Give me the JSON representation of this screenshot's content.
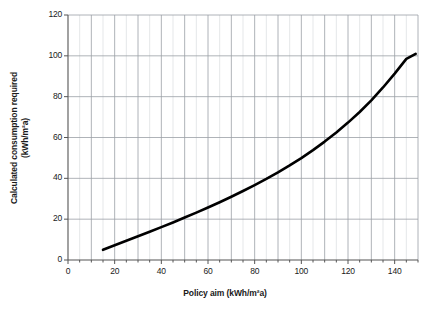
{
  "chart_data": {
    "type": "line",
    "title": "",
    "xlabel": "Policy aim (kWh/m²a)",
    "ylabel_line1": "Calculated consumption required",
    "ylabel_line2": "(kWh/m²a)",
    "xlim": [
      0,
      150
    ],
    "ylim": [
      0,
      120
    ],
    "xticks": [
      0,
      20,
      40,
      60,
      80,
      100,
      120,
      140
    ],
    "yticks": [
      0,
      20,
      40,
      60,
      80,
      100,
      120
    ],
    "xtick_labels": [
      "0",
      "20",
      "40",
      "60",
      "80",
      "100",
      "120",
      "140"
    ],
    "ytick_labels": [
      "0",
      "20",
      "40",
      "60",
      "80",
      "100",
      "120"
    ],
    "grid": {
      "vertical_major_step": 10,
      "vertical_minor_step": 5,
      "horizontal_step": 20,
      "major_color": "#9aa0a6",
      "minor_color": "#d4d7da"
    },
    "legend": "none",
    "series": [
      {
        "name": "Calculated consumption required",
        "color": "#000000",
        "line_width": 2.6,
        "x": [
          15,
          20,
          25,
          30,
          35,
          40,
          45,
          50,
          55,
          60,
          65,
          70,
          75,
          80,
          85,
          90,
          95,
          100,
          105,
          110,
          115,
          120,
          125,
          130,
          135,
          140,
          145,
          149
        ],
        "y": [
          5.0,
          7.2,
          9.4,
          11.6,
          13.8,
          16.1,
          18.4,
          20.8,
          23.2,
          25.7,
          28.3,
          31.0,
          33.8,
          36.7,
          39.7,
          42.9,
          46.3,
          49.9,
          53.8,
          58.0,
          62.5,
          67.3,
          72.5,
          78.2,
          84.5,
          91.3,
          98.5,
          101.0
        ]
      }
    ]
  },
  "axes": {
    "axis_color": "#555555",
    "tick_color": "#555555"
  }
}
